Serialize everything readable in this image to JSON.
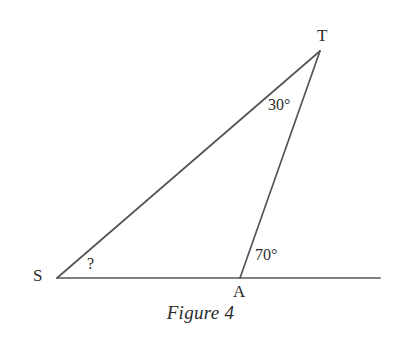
{
  "figure": {
    "caption": "Figure 4",
    "background_color": "#ffffff",
    "line_color": "#555555",
    "text_color": "#2b2b2b",
    "width": 401,
    "height": 347
  },
  "vertices": [
    {
      "name": "S",
      "label": "S",
      "x": 57,
      "y": 278,
      "label_x": 33,
      "label_y": 267
    },
    {
      "name": "A",
      "label": "A",
      "x": 240,
      "y": 278,
      "label_x": 233,
      "label_y": 283
    },
    {
      "name": "T",
      "label": "T",
      "x": 320,
      "y": 51,
      "label_x": 317,
      "label_y": 27
    }
  ],
  "segments": [
    {
      "name": "baseline-S-to-right",
      "from": [
        57,
        278
      ],
      "to": [
        380,
        278
      ]
    },
    {
      "name": "side-S-to-T",
      "from": [
        57,
        278
      ],
      "to": [
        320,
        51
      ]
    },
    {
      "name": "side-T-to-A",
      "from": [
        320,
        51
      ],
      "to": [
        240,
        278
      ]
    }
  ],
  "angles": [
    {
      "name": "angle-at-T",
      "label": "30°",
      "value": 30,
      "unit": "degrees",
      "at_vertex": "T"
    },
    {
      "name": "angle-at-A-exterior",
      "label": "70°",
      "value": 70,
      "unit": "degrees",
      "at_vertex": "A"
    },
    {
      "name": "angle-at-S-unknown",
      "label": "?",
      "value": null,
      "unit": "degrees",
      "at_vertex": "S"
    }
  ],
  "chart_data": {
    "type": "diagram",
    "title": "Figure 4",
    "points": {
      "S": [
        57,
        278
      ],
      "A": [
        240,
        278
      ],
      "T": [
        320,
        51
      ],
      "baseline_end": [
        380,
        278
      ]
    },
    "labels": [
      "S",
      "A",
      "T",
      "30°",
      "70°",
      "?",
      "Figure 4"
    ]
  }
}
